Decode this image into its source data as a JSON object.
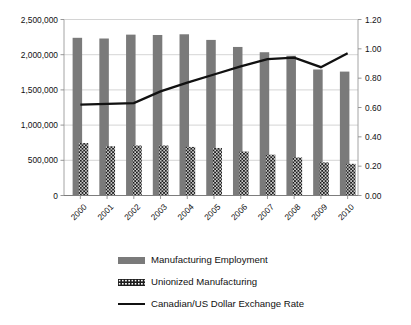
{
  "chart_data": {
    "type": "bar",
    "title": "",
    "subtitle": "",
    "xlabel": "",
    "ylabel": "",
    "y2label": "",
    "categories": [
      "2000",
      "2001",
      "2002",
      "2003",
      "2004",
      "2005",
      "2006",
      "2007",
      "2008",
      "2009",
      "2010"
    ],
    "ylim": [
      0,
      2500000
    ],
    "y2lim": [
      0,
      1.2
    ],
    "yticks": [
      "0",
      "500,000",
      "1,000,000",
      "1,500,000",
      "2,000,000",
      "2,500,000"
    ],
    "ytick_values": [
      0,
      500000,
      1000000,
      1500000,
      2000000,
      2500000
    ],
    "y2ticks": [
      "0.00",
      "0.20",
      "0.40",
      "0.60",
      "0.80",
      "1.00",
      "1.20"
    ],
    "y2tick_values": [
      0.0,
      0.2,
      0.4,
      0.6,
      0.8,
      1.0,
      1.2
    ],
    "grid": true,
    "legend_position": "bottom",
    "series": [
      {
        "name": "Manufacturing Employment",
        "type": "bar",
        "axis": "left",
        "color": "#7a7a7a",
        "values": [
          2240000,
          2230000,
          2285000,
          2280000,
          2290000,
          2210000,
          2110000,
          2035000,
          1985000,
          1790000,
          1760000
        ]
      },
      {
        "name": "Unionized Manufacturing",
        "type": "bar",
        "axis": "left",
        "color": "#1d1d1d",
        "pattern": "dotted-hatch",
        "values": [
          745000,
          700000,
          710000,
          710000,
          690000,
          675000,
          625000,
          580000,
          540000,
          470000,
          450000
        ]
      },
      {
        "name": "Canadian/US Dollar Exchange Rate",
        "type": "line",
        "axis": "right",
        "color": "#111111",
        "values": [
          0.62,
          0.625,
          0.63,
          0.71,
          0.77,
          0.825,
          0.88,
          0.93,
          0.94,
          0.875,
          0.97
        ]
      }
    ]
  },
  "legend": {
    "items": [
      {
        "label": "Manufacturing Employment",
        "marker": "bar-solid-icon"
      },
      {
        "label": "Unionized Manufacturing",
        "marker": "bar-hatch-icon"
      },
      {
        "label": "Canadian/US Dollar Exchange Rate",
        "marker": "line-icon"
      }
    ]
  }
}
